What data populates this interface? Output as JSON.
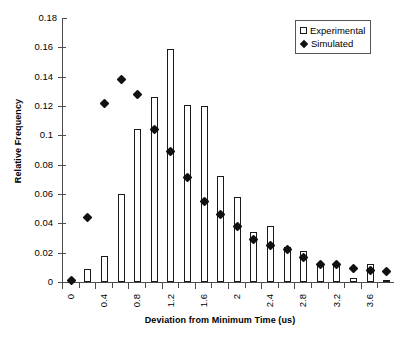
{
  "chart_data": {
    "type": "bar",
    "title": "",
    "xlabel": "Deviation from Minimum Time (us)",
    "ylabel": "Relative Frequency",
    "xlim": [
      0,
      4.0
    ],
    "ylim": [
      0,
      0.18
    ],
    "grid": false,
    "legend_position": "top-right",
    "x_tick_interval": 0.2,
    "x_labeled_interval": 0.4,
    "y_tick_interval": 0.02,
    "y_tick_labels": [
      "0",
      "0.02",
      "0.04",
      "0.06",
      "0.08",
      "0.1",
      "0.12",
      "0.14",
      "0.16",
      "0.18"
    ],
    "y_tick_values": [
      0,
      0.02,
      0.04,
      0.06,
      0.08,
      0.1,
      0.12,
      0.14,
      0.16,
      0.18
    ],
    "x_tick_values": [
      0,
      0.2,
      0.4,
      0.6,
      0.8,
      1.0,
      1.2,
      1.4,
      1.6,
      1.8,
      2.0,
      2.2,
      2.4,
      2.6,
      2.8,
      3.0,
      3.2,
      3.4,
      3.6,
      3.8
    ],
    "x_tick_labels": [
      "0",
      "",
      "0.4",
      "",
      "0.8",
      "",
      "1.2",
      "",
      "1.6",
      "",
      "2",
      "",
      "2.4",
      "",
      "2.8",
      "",
      "3.2",
      "",
      "3.6",
      ""
    ],
    "categories": [
      0,
      0.2,
      0.4,
      0.6,
      0.8,
      1.0,
      1.2,
      1.4,
      1.6,
      1.8,
      2.0,
      2.2,
      2.4,
      2.6,
      2.8,
      3.0,
      3.2,
      3.4,
      3.6,
      3.8
    ],
    "series": [
      {
        "name": "Experimental",
        "type": "bar",
        "color": "#ffffff",
        "edge_color": "#1a1a1a",
        "values": [
          0.001,
          0.009,
          0.018,
          0.06,
          0.104,
          0.126,
          0.159,
          0.121,
          0.12,
          0.072,
          0.058,
          0.034,
          0.038,
          0.024,
          0.021,
          0.012,
          0.012,
          0.003,
          0.012,
          0.001
        ]
      },
      {
        "name": "Simulated",
        "type": "scatter",
        "marker": "diamond",
        "color": "#111111",
        "values": [
          0.001,
          0.044,
          0.122,
          0.138,
          0.128,
          0.104,
          0.089,
          0.071,
          0.055,
          0.046,
          0.038,
          0.029,
          0.025,
          0.022,
          0.017,
          0.012,
          0.012,
          0.009,
          0.008,
          0.007
        ]
      }
    ]
  },
  "legend": {
    "items": [
      {
        "label": "Experimental",
        "swatch": "white-square"
      },
      {
        "label": "Simulated",
        "swatch": "black-diamond"
      }
    ]
  },
  "axes": {
    "x_title": "Deviation from Minimum Time (us)",
    "y_title": "Relative Frequency"
  }
}
